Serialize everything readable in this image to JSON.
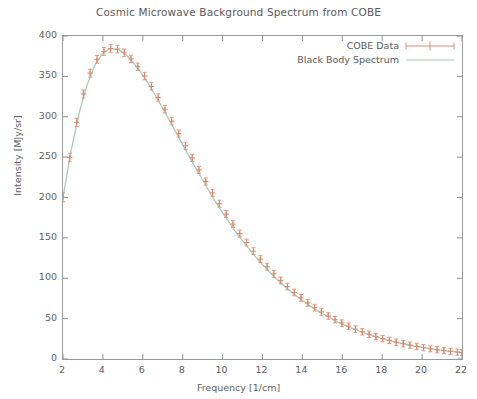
{
  "chart_data": {
    "type": "line",
    "title": "Cosmic Microwave Background Spectrum from COBE",
    "xlabel": "Frequency [1/cm]",
    "ylabel": "Intensity [MJy/sr]",
    "xlim": [
      2,
      22
    ],
    "ylim": [
      0,
      400
    ],
    "xticks": [
      2,
      4,
      6,
      8,
      10,
      12,
      14,
      16,
      18,
      20,
      22
    ],
    "yticks": [
      0,
      50,
      100,
      150,
      200,
      250,
      300,
      350,
      400
    ],
    "grid": false,
    "legend_position": "top-right",
    "series": [
      {
        "name": "COBE Data",
        "style": "points-with-errorbars",
        "color": "#e08a6e",
        "x": [
          2.0,
          2.34,
          2.68,
          3.02,
          3.36,
          3.7,
          4.05,
          4.39,
          4.73,
          5.07,
          5.41,
          5.75,
          6.09,
          6.43,
          6.77,
          7.11,
          7.45,
          7.8,
          8.14,
          8.48,
          8.82,
          9.16,
          9.5,
          9.84,
          10.18,
          10.52,
          10.86,
          11.2,
          11.55,
          11.89,
          12.23,
          12.57,
          12.91,
          13.25,
          13.59,
          13.93,
          14.27,
          14.61,
          14.95,
          15.3,
          15.64,
          15.98,
          16.32,
          16.66,
          17.0,
          17.34,
          17.68,
          18.02,
          18.36,
          18.7,
          19.05,
          19.39,
          19.73,
          20.07,
          20.41,
          20.75,
          21.09,
          21.43,
          21.77,
          22.0
        ],
        "y": [
          200.3,
          249.5,
          293.0,
          328.2,
          354.0,
          371.2,
          380.8,
          384.6,
          383.7,
          379.1,
          371.6,
          361.9,
          350.4,
          337.6,
          323.8,
          309.3,
          294.4,
          279.2,
          264.0,
          249.0,
          234.2,
          219.8,
          205.8,
          192.3,
          179.4,
          167.1,
          155.3,
          144.2,
          133.6,
          123.7,
          114.3,
          105.5,
          97.3,
          89.6,
          82.4,
          75.7,
          69.4,
          63.6,
          58.3,
          53.3,
          48.7,
          44.5,
          40.6,
          37.0,
          33.7,
          30.6,
          27.9,
          25.3,
          23.0,
          20.8,
          18.9,
          17.1,
          15.5,
          14.1,
          12.7,
          11.5,
          10.4,
          9.4,
          8.5,
          8.0
        ],
        "yerr": [
          5.5,
          5.3,
          5.1,
          5.0,
          4.9,
          4.8,
          4.8,
          4.7,
          4.7,
          4.7,
          4.6,
          4.6,
          4.6,
          4.5,
          4.5,
          4.5,
          4.5,
          4.4,
          4.4,
          4.4,
          4.4,
          4.4,
          4.3,
          4.3,
          4.3,
          4.3,
          4.3,
          4.2,
          4.2,
          4.2,
          4.2,
          4.2,
          4.2,
          4.1,
          4.1,
          4.1,
          4.1,
          4.1,
          4.1,
          4.0,
          4.0,
          4.0,
          4.0,
          4.0,
          4.0,
          4.0,
          3.9,
          3.9,
          3.9,
          3.9,
          3.9,
          3.9,
          3.9,
          3.8,
          3.8,
          3.8,
          3.8,
          3.8,
          3.8,
          3.8
        ]
      },
      {
        "name": "Black Body Spectrum",
        "style": "line",
        "color": "#a8ccb8",
        "x": [
          2.0,
          2.4,
          2.8,
          3.2,
          3.6,
          4.0,
          4.4,
          4.8,
          5.2,
          5.6,
          6.0,
          6.4,
          6.8,
          7.2,
          7.6,
          8.0,
          8.4,
          8.8,
          9.2,
          9.6,
          10.0,
          10.4,
          10.8,
          11.2,
          11.6,
          12.0,
          12.4,
          12.8,
          13.2,
          13.6,
          14.0,
          14.4,
          14.8,
          15.2,
          15.6,
          16.0,
          16.4,
          16.8,
          17.2,
          17.6,
          18.0,
          18.4,
          18.8,
          19.2,
          19.6,
          20.0,
          20.4,
          20.8,
          21.2,
          21.6,
          22.0
        ],
        "y": [
          200.0,
          257.0,
          304.0,
          339.0,
          364.0,
          379.0,
          384.5,
          383.0,
          376.0,
          365.0,
          351.5,
          336.0,
          319.0,
          301.5,
          283.5,
          265.5,
          247.5,
          230.0,
          213.0,
          196.5,
          181.0,
          166.5,
          152.5,
          140.0,
          128.0,
          117.0,
          106.5,
          97.0,
          88.0,
          80.0,
          72.5,
          65.5,
          59.0,
          53.5,
          48.0,
          43.3,
          39.0,
          35.0,
          31.4,
          28.2,
          25.2,
          22.6,
          20.2,
          18.0,
          16.1,
          14.4,
          12.8,
          11.4,
          10.2,
          9.1,
          8.1
        ]
      }
    ],
    "legend": [
      "COBE Data",
      "Black Body Spectrum"
    ]
  }
}
